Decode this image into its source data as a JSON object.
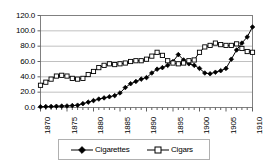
{
  "chart_data": {
    "type": "line",
    "title": "",
    "subtitle": "",
    "xlabel": "",
    "ylabel": "",
    "xlim": [
      1870,
      1910
    ],
    "ylim": [
      0.0,
      120.0
    ],
    "grid": true,
    "legend_position": "bottom",
    "y_ticks": [
      "0.0",
      "20.0",
      "40.0",
      "60.0",
      "80.0",
      "100.0",
      "120.0"
    ],
    "y_tick_values": [
      0.0,
      20.0,
      40.0,
      60.0,
      80.0,
      100.0,
      120.0
    ],
    "x_ticks": [
      "1870",
      "1875",
      "1880",
      "1885",
      "1890",
      "1895",
      "1900",
      "1905",
      "1910"
    ],
    "x_tick_values": [
      1870,
      1875,
      1880,
      1885,
      1890,
      1895,
      1900,
      1905,
      1910
    ],
    "x": [
      1870,
      1871,
      1872,
      1873,
      1874,
      1875,
      1876,
      1877,
      1878,
      1879,
      1880,
      1881,
      1882,
      1883,
      1884,
      1885,
      1886,
      1887,
      1888,
      1889,
      1890,
      1891,
      1892,
      1893,
      1894,
      1895,
      1896,
      1897,
      1898,
      1899,
      1900,
      1901,
      1902,
      1903,
      1904,
      1905,
      1906,
      1907,
      1908,
      1909,
      1910
    ],
    "series": [
      {
        "name": "Cigarettes",
        "marker": "filled-diamond",
        "color": "#000000",
        "values": [
          1.0,
          1.2,
          1.4,
          1.6,
          1.8,
          2.0,
          2.5,
          3.0,
          5.0,
          7.0,
          9.0,
          11.0,
          12.5,
          14.0,
          15.5,
          19.0,
          26.0,
          31.0,
          34.0,
          37.0,
          39.0,
          45.0,
          50.0,
          52.0,
          55.0,
          60.0,
          69.0,
          62.0,
          57.0,
          55.0,
          51.0,
          45.0,
          44.0,
          46.0,
          48.0,
          51.0,
          63.0,
          75.0,
          84.0,
          92.0,
          105.0
        ]
      },
      {
        "name": "Cigars",
        "marker": "open-square",
        "color": "#000000",
        "values": [
          29.0,
          33.0,
          37.0,
          41.0,
          42.0,
          41.0,
          38.0,
          37.0,
          38.0,
          43.0,
          47.0,
          52.0,
          55.0,
          57.0,
          56.0,
          57.0,
          58.0,
          60.0,
          61.0,
          61.0,
          63.0,
          67.0,
          72.0,
          68.0,
          61.0,
          58.0,
          57.0,
          58.0,
          61.0,
          62.0,
          72.0,
          79.0,
          81.0,
          84.0,
          82.0,
          81.0,
          81.0,
          83.0,
          77.0,
          73.0,
          72.0
        ]
      }
    ]
  },
  "legend": {
    "entries": [
      {
        "label": "Cigarettes",
        "marker": "filled-diamond"
      },
      {
        "label": "Cigars",
        "marker": "open-square"
      }
    ]
  },
  "axes": {
    "frame_color": "#808080",
    "gridline_color": "#c0c0c0",
    "plot_background": "#ffffff"
  }
}
